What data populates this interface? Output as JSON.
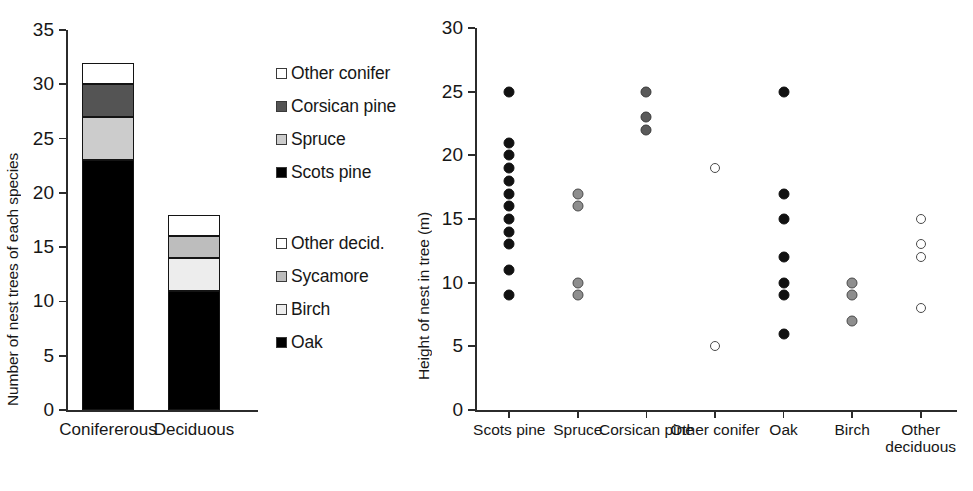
{
  "chart_data": [
    {
      "type": "bar",
      "id": "nest-trees-stacked-bar",
      "title": "",
      "xlabel": "",
      "ylabel": "Number of nest trees of each species",
      "ylim": [
        0,
        35
      ],
      "yticks": [
        0,
        5,
        10,
        15,
        20,
        25,
        30,
        35
      ],
      "grid": false,
      "stacked": true,
      "categories": [
        "Conifererous",
        "Deciduous"
      ],
      "series": [
        {
          "name": "Scots pine",
          "values": [
            23,
            0
          ],
          "fill": "#000000",
          "group": "Conifererous"
        },
        {
          "name": "Spruce",
          "values": [
            4,
            0
          ],
          "fill": "#cccccc",
          "group": "Conifererous"
        },
        {
          "name": "Corsican pine",
          "values": [
            3,
            0
          ],
          "fill": "#545454",
          "group": "Conifererous"
        },
        {
          "name": "Other conifer",
          "values": [
            2,
            0
          ],
          "fill": "#ffffff",
          "group": "Conifererous"
        },
        {
          "name": "Oak",
          "values": [
            0,
            11
          ],
          "fill": "#000000",
          "group": "Deciduous"
        },
        {
          "name": "Birch",
          "values": [
            0,
            3
          ],
          "fill": "#ededed",
          "group": "Deciduous"
        },
        {
          "name": "Sycamore",
          "values": [
            0,
            2
          ],
          "fill": "#bdbdbd",
          "group": "Deciduous"
        },
        {
          "name": "Other decid.",
          "values": [
            0,
            2
          ],
          "fill": "#ffffff",
          "group": "Deciduous"
        }
      ],
      "stack_totals": [
        32,
        18
      ],
      "legend_position": "right",
      "legend_groups": [
        {
          "entries": [
            {
              "label": "Other conifer",
              "swatch": "#ffffff"
            },
            {
              "label": "Corsican pine",
              "swatch": "#545454"
            },
            {
              "label": "Spruce",
              "swatch": "#cccccc"
            },
            {
              "label": "Scots pine",
              "swatch": "#000000"
            }
          ]
        },
        {
          "entries": [
            {
              "label": "Other decid.",
              "swatch": "#ffffff"
            },
            {
              "label": "Sycamore",
              "swatch": "#bdbdbd"
            },
            {
              "label": "Birch",
              "swatch": "#ededed"
            },
            {
              "label": "Oak",
              "swatch": "#000000"
            }
          ]
        }
      ]
    },
    {
      "type": "scatter",
      "id": "nest-height-by-species",
      "title": "",
      "xlabel": "",
      "ylabel": "Height of nest in tree (m)",
      "ylim": [
        0,
        30
      ],
      "yticks": [
        0,
        5,
        10,
        15,
        20,
        25,
        30
      ],
      "grid": false,
      "categories": [
        "Scots pine",
        "Spruce",
        "Corsican pine",
        "Other conifer",
        "Oak",
        "Birch",
        "Other deciduous"
      ],
      "series": [
        {
          "name": "Scots pine",
          "marker": "filled-black",
          "values": [
            25,
            21,
            20,
            19,
            18,
            17,
            16,
            15,
            14,
            13,
            11,
            9
          ]
        },
        {
          "name": "Spruce",
          "marker": "filled-gray",
          "values": [
            17,
            16,
            10,
            9
          ]
        },
        {
          "name": "Corsican pine",
          "marker": "filled-darkgray",
          "values": [
            25,
            23,
            22
          ]
        },
        {
          "name": "Other conifer",
          "marker": "open",
          "values": [
            19,
            5
          ]
        },
        {
          "name": "Oak",
          "marker": "filled-black",
          "values": [
            25,
            17,
            15,
            12,
            10,
            9,
            6
          ]
        },
        {
          "name": "Birch",
          "marker": "filled-gray",
          "values": [
            10,
            9,
            7
          ]
        },
        {
          "name": "Other deciduous",
          "marker": "open",
          "values": [
            15,
            13,
            12,
            8
          ]
        }
      ]
    }
  ]
}
